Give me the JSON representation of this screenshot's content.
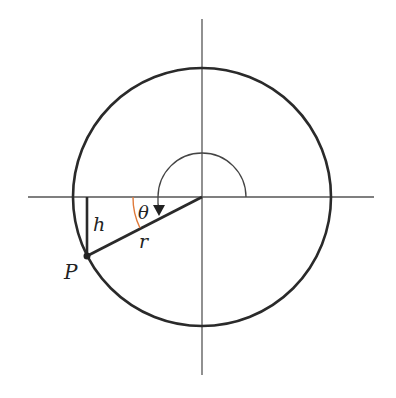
{
  "diagram": {
    "type": "unit-circle-angle",
    "labels": {
      "point": "P",
      "height": "h",
      "radius": "r",
      "angle": "θ"
    },
    "colors": {
      "stroke": "#2a2a2a",
      "axis": "#555555",
      "angle_arc": "#e07a3a",
      "background": "#ffffff"
    },
    "geometry": {
      "center": [
        202,
        197
      ],
      "radius": 129,
      "point_P": [
        87,
        256
      ]
    }
  }
}
